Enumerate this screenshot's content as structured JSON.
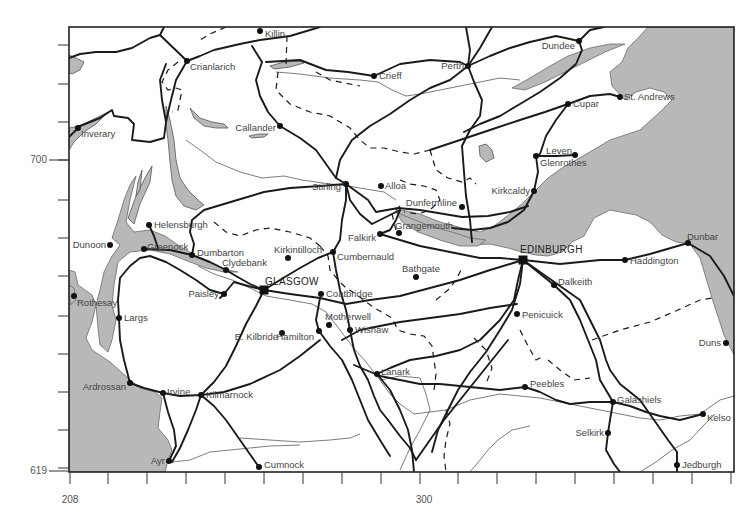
{
  "map": {
    "frame": {
      "x": 69,
      "y": 27,
      "width": 665,
      "height": 445
    },
    "axis": {
      "y_labels": [
        {
          "text": "700",
          "x": 47,
          "y": 163
        },
        {
          "text": "619",
          "x": 47,
          "y": 474
        }
      ],
      "x_labels": [
        {
          "text": "208",
          "x": 70,
          "y": 503
        },
        {
          "text": "300",
          "x": 424,
          "y": 503
        }
      ],
      "left_ticks_y": [
        45,
        84,
        122,
        160,
        200,
        238,
        276,
        316,
        354,
        392,
        430,
        468
      ],
      "bottom_ticks_x": [
        70,
        108,
        147,
        186,
        225,
        264,
        303,
        342,
        381,
        420,
        458,
        497,
        536,
        575,
        614,
        653,
        692,
        731
      ]
    },
    "cities": [
      {
        "name": "GLASGOW",
        "x": 264,
        "y": 290,
        "lx": 265,
        "ly": 285
      },
      {
        "name": "EDINBURGH",
        "x": 523,
        "y": 260,
        "lx": 520,
        "ly": 253
      }
    ],
    "towns": [
      {
        "name": "Killin",
        "x": 260,
        "y": 31,
        "lx": 265,
        "ly": 37,
        "anchor": "start"
      },
      {
        "name": "Crianlarich",
        "x": 187,
        "y": 61,
        "lx": 190,
        "ly": 70,
        "anchor": "start"
      },
      {
        "name": "Crieff",
        "x": 374,
        "y": 76,
        "lx": 379,
        "ly": 79,
        "anchor": "start"
      },
      {
        "name": "Perth",
        "x": 468,
        "y": 66,
        "lx": 464,
        "ly": 69,
        "anchor": "end"
      },
      {
        "name": "Dundee",
        "x": 579,
        "y": 41,
        "lx": 575,
        "ly": 49,
        "anchor": "end"
      },
      {
        "name": "St. Andrews",
        "x": 620,
        "y": 97,
        "lx": 624,
        "ly": 100,
        "anchor": "start"
      },
      {
        "name": "Cupar",
        "x": 568,
        "y": 104,
        "lx": 573,
        "ly": 107,
        "anchor": "start"
      },
      {
        "name": "Inverary",
        "x": 78,
        "y": 128,
        "lx": 81,
        "ly": 137,
        "anchor": "start"
      },
      {
        "name": "Callander",
        "x": 280,
        "y": 126,
        "lx": 276,
        "ly": 131,
        "anchor": "end"
      },
      {
        "name": "Leven",
        "x": 575,
        "y": 155,
        "lx": 572,
        "ly": 154,
        "anchor": "end"
      },
      {
        "name": "Glenrothes",
        "x": 536,
        "y": 156,
        "lx": 540,
        "ly": 166,
        "anchor": "start"
      },
      {
        "name": "Stirling",
        "x": 346,
        "y": 184,
        "lx": 341,
        "ly": 190,
        "anchor": "end"
      },
      {
        "name": "Alloa",
        "x": 381,
        "y": 186,
        "lx": 385,
        "ly": 189,
        "anchor": "start"
      },
      {
        "name": "Kirkcaldy",
        "x": 534,
        "y": 191,
        "lx": 530,
        "ly": 194,
        "anchor": "end"
      },
      {
        "name": "Dunfermline",
        "x": 462,
        "y": 207,
        "lx": 457,
        "ly": 206,
        "anchor": "end"
      },
      {
        "name": "Helensburgh",
        "x": 149,
        "y": 225,
        "lx": 154,
        "ly": 228,
        "anchor": "start"
      },
      {
        "name": "Grangemouth",
        "x": 399,
        "y": 233,
        "lx": 395,
        "ly": 229,
        "anchor": "start"
      },
      {
        "name": "Falkirk",
        "x": 380,
        "y": 234,
        "lx": 376,
        "ly": 241,
        "anchor": "end"
      },
      {
        "name": "Dunoon",
        "x": 110,
        "y": 245,
        "lx": 106,
        "ly": 248,
        "anchor": "end"
      },
      {
        "name": "Greenock",
        "x": 144,
        "y": 249,
        "lx": 147,
        "ly": 250,
        "anchor": "start"
      },
      {
        "name": "Dumbarton",
        "x": 192,
        "y": 255,
        "lx": 197,
        "ly": 256,
        "anchor": "start"
      },
      {
        "name": "Kirkintilloch",
        "x": 288,
        "y": 258,
        "lx": 274,
        "ly": 253,
        "anchor": "start"
      },
      {
        "name": "Cumbernauld",
        "x": 333,
        "y": 252,
        "lx": 337,
        "ly": 260,
        "anchor": "start"
      },
      {
        "name": "Dunbar",
        "x": 688,
        "y": 243,
        "lx": 687,
        "ly": 240,
        "anchor": "start"
      },
      {
        "name": "Haddington",
        "x": 625,
        "y": 260,
        "lx": 630,
        "ly": 264,
        "anchor": "start"
      },
      {
        "name": "Clydebank",
        "x": 226,
        "y": 270,
        "lx": 222,
        "ly": 266,
        "anchor": "start"
      },
      {
        "name": "Bathgate",
        "x": 416,
        "y": 277,
        "lx": 402,
        "ly": 272,
        "anchor": "start"
      },
      {
        "name": "Dalkeith",
        "x": 554,
        "y": 285,
        "lx": 558,
        "ly": 285,
        "anchor": "start"
      },
      {
        "name": "Rothesay",
        "x": 74,
        "y": 296,
        "lx": 77,
        "ly": 306,
        "anchor": "start"
      },
      {
        "name": "Paisley",
        "x": 224,
        "y": 294,
        "lx": 219,
        "ly": 297,
        "anchor": "end"
      },
      {
        "name": "Coatbridge",
        "x": 321,
        "y": 294,
        "lx": 326,
        "ly": 297,
        "anchor": "start"
      },
      {
        "name": "Penicuick",
        "x": 517,
        "y": 314,
        "lx": 522,
        "ly": 318,
        "anchor": "start"
      },
      {
        "name": "Largs",
        "x": 119,
        "y": 318,
        "lx": 124,
        "ly": 321,
        "anchor": "start"
      },
      {
        "name": "Motherwell",
        "x": 329,
        "y": 325,
        "lx": 325,
        "ly": 320,
        "anchor": "start"
      },
      {
        "name": "E. Kilbride",
        "x": 282,
        "y": 333,
        "lx": 278,
        "ly": 340,
        "anchor": "end"
      },
      {
        "name": "Hamilton",
        "x": 319,
        "y": 331,
        "lx": 314,
        "ly": 340,
        "anchor": "end"
      },
      {
        "name": "Wishaw",
        "x": 350,
        "y": 330,
        "lx": 355,
        "ly": 333,
        "anchor": "start"
      },
      {
        "name": "Duns",
        "x": 726,
        "y": 343,
        "lx": 721,
        "ly": 346,
        "anchor": "end"
      },
      {
        "name": "Lanark",
        "x": 377,
        "y": 374,
        "lx": 381,
        "ly": 375,
        "anchor": "start"
      },
      {
        "name": "Peebles",
        "x": 525,
        "y": 387,
        "lx": 530,
        "ly": 387,
        "anchor": "start"
      },
      {
        "name": "Ardrossan",
        "x": 130,
        "y": 383,
        "lx": 126,
        "ly": 390,
        "anchor": "end"
      },
      {
        "name": "Irvine",
        "x": 163,
        "y": 393,
        "lx": 167,
        "ly": 395,
        "anchor": "start"
      },
      {
        "name": "Kilmarnock",
        "x": 201,
        "y": 395,
        "lx": 206,
        "ly": 398,
        "anchor": "start"
      },
      {
        "name": "Galashiels",
        "x": 613,
        "y": 402,
        "lx": 617,
        "ly": 403,
        "anchor": "start"
      },
      {
        "name": "Kelso",
        "x": 703,
        "y": 414,
        "lx": 707,
        "ly": 421,
        "anchor": "start"
      },
      {
        "name": "Selkirk",
        "x": 608,
        "y": 433,
        "lx": 604,
        "ly": 436,
        "anchor": "end"
      },
      {
        "name": "Ayr",
        "x": 169,
        "y": 461,
        "lx": 165,
        "ly": 464,
        "anchor": "end"
      },
      {
        "name": "Cumnock",
        "x": 259,
        "y": 467,
        "lx": 264,
        "ly": 468,
        "anchor": "start"
      },
      {
        "name": "Jedburgh",
        "x": 677,
        "y": 465,
        "lx": 682,
        "ly": 468,
        "anchor": "start"
      }
    ]
  }
}
